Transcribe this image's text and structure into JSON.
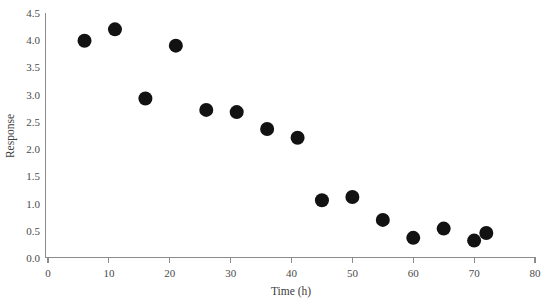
{
  "chart_data": {
    "type": "scatter",
    "title": "",
    "xlabel": "Time (h)",
    "ylabel": "Response",
    "xlim": [
      0,
      80
    ],
    "ylim": [
      0.0,
      4.5
    ],
    "grid": false,
    "legend": null,
    "xticks": [
      0,
      10,
      20,
      30,
      40,
      50,
      60,
      70,
      80
    ],
    "xtick_labels": [
      "0",
      "10",
      "20",
      "30",
      "40",
      "50",
      "60",
      "70",
      "80"
    ],
    "yticks": [
      0.0,
      0.5,
      1.0,
      1.5,
      2.0,
      2.5,
      3.0,
      3.5,
      4.0,
      4.5
    ],
    "ytick_labels": [
      "0.0",
      "0.5",
      "1.0",
      "1.5",
      "2.0",
      "2.5",
      "3.0",
      "3.5",
      "4.0",
      "4.5"
    ],
    "marker": {
      "shape": "circle",
      "color": "#121212",
      "size_px": 14
    },
    "series": [
      {
        "name": "Response vs Time",
        "points": [
          {
            "x": 6,
            "y": 3.99
          },
          {
            "x": 11,
            "y": 4.2
          },
          {
            "x": 16,
            "y": 2.93
          },
          {
            "x": 21,
            "y": 3.9
          },
          {
            "x": 26,
            "y": 2.72
          },
          {
            "x": 31,
            "y": 2.68
          },
          {
            "x": 36,
            "y": 2.37
          },
          {
            "x": 41,
            "y": 2.21
          },
          {
            "x": 45,
            "y": 1.06
          },
          {
            "x": 50,
            "y": 1.12
          },
          {
            "x": 55,
            "y": 0.7
          },
          {
            "x": 60,
            "y": 0.37
          },
          {
            "x": 65,
            "y": 0.54
          },
          {
            "x": 70,
            "y": 0.32
          },
          {
            "x": 72,
            "y": 0.46
          }
        ]
      }
    ]
  }
}
